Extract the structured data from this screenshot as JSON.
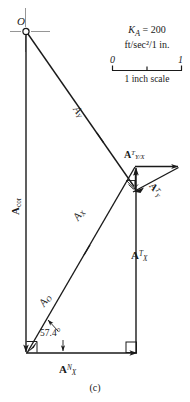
{
  "figure": {
    "caption": "(c)",
    "origin_label": "O",
    "angle_label": "57.4°"
  },
  "legend": {
    "scale_factor_symbol": "K",
    "scale_factor_subscript": "A",
    "scale_factor_equals": "=",
    "scale_factor_value": "200",
    "units_line": "ft/sec²/1 in.",
    "scale_tick_min": "0",
    "scale_tick_max": "1",
    "scale_caption": "1 inch scale"
  },
  "vectors": [
    {
      "id": "A_Y",
      "base": "A",
      "sub": "Y",
      "sup": "",
      "italic": true,
      "description": "acceleration of point Y, from origin O down-right to intersection"
    },
    {
      "id": "A_X",
      "base": "A",
      "sub": "X",
      "sup": "",
      "italic": true,
      "description": "acceleration of point X, from lower-left corner up-right"
    },
    {
      "id": "A_O",
      "base": "A",
      "sub": "O",
      "sup": "",
      "italic": true,
      "description": "acceleration of point O along lower diagonal"
    },
    {
      "id": "A_cor",
      "base": "A",
      "sub": "cor",
      "sup": "",
      "italic": false,
      "description": "Coriolis acceleration, vertical left edge pointing down"
    },
    {
      "id": "A_X_T",
      "base": "A",
      "sub": "X",
      "sup": "T",
      "italic": false,
      "description": "tangential acceleration of X, vertical right edge pointing up"
    },
    {
      "id": "A_X_N",
      "base": "A",
      "sub": "X",
      "sup": "N",
      "italic": false,
      "description": "normal acceleration of X, horizontal bottom edge pointing right"
    },
    {
      "id": "A_Y_over_X_T",
      "base": "A",
      "sub": "Y/X",
      "sup": "T",
      "italic": false,
      "description": "tangential acceleration of Y relative to X, horizontal pointing right"
    },
    {
      "id": "A_Y_T",
      "base": "A",
      "sub": "Y",
      "sup": "T",
      "italic": false,
      "description": "tangential acceleration of Y, short diagonal pointing down-left"
    }
  ],
  "colors": {
    "line": "#1a1a1a",
    "background": "#ffffff"
  }
}
